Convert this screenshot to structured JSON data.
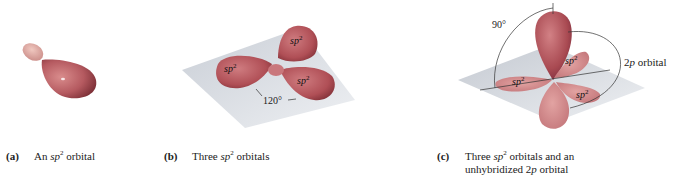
{
  "figure": {
    "colors": {
      "orbital_dark": "#9e3f45",
      "orbital_mid": "#c76a6e",
      "orbital_light": "#e3a6a4",
      "plane": "#d3d8de",
      "line": "#333333",
      "text": "#222222"
    },
    "panels": [
      {
        "id": "a",
        "label": "(a)",
        "caption_pre": "An ",
        "caption_it": "sp",
        "caption_sup": "2",
        "caption_post": " orbital",
        "caption_line2": ""
      },
      {
        "id": "b",
        "label": "(b)",
        "caption_pre": "Three ",
        "caption_it": "sp",
        "caption_sup": "2",
        "caption_post": " orbitals",
        "caption_line2": "",
        "lobe_label": "sp",
        "lobe_sup": "2",
        "angle_label": "120°"
      },
      {
        "id": "c",
        "label": "(c)",
        "caption_pre": "Three ",
        "caption_it": "sp",
        "caption_sup": "2",
        "caption_post": " orbitals and an",
        "caption_line2_pre": "unhybridized 2",
        "caption_line2_it": "p",
        "caption_line2_post": " orbital",
        "lobe_label": "sp",
        "lobe_sup": "2",
        "angle_label": "90°",
        "p_label_num": "2",
        "p_label_it": "p",
        "p_label_post": " orbital"
      }
    ]
  }
}
